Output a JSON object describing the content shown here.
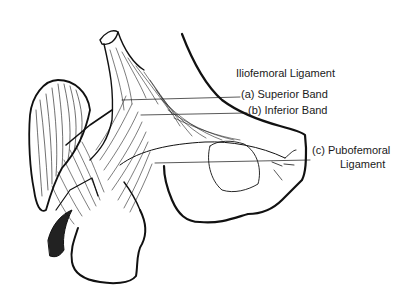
{
  "figure": {
    "title": "Iliofemoral Ligament",
    "labels": [
      {
        "id": "a",
        "text": "(a) Superior Band"
      },
      {
        "id": "b",
        "text": "(b) Inferior Band"
      },
      {
        "id": "c_line1",
        "text": "(c) Pubofemoral"
      },
      {
        "id": "c_line2",
        "text": "Ligament"
      }
    ],
    "colors": {
      "ink": "#111111",
      "background": "#ffffff"
    }
  }
}
